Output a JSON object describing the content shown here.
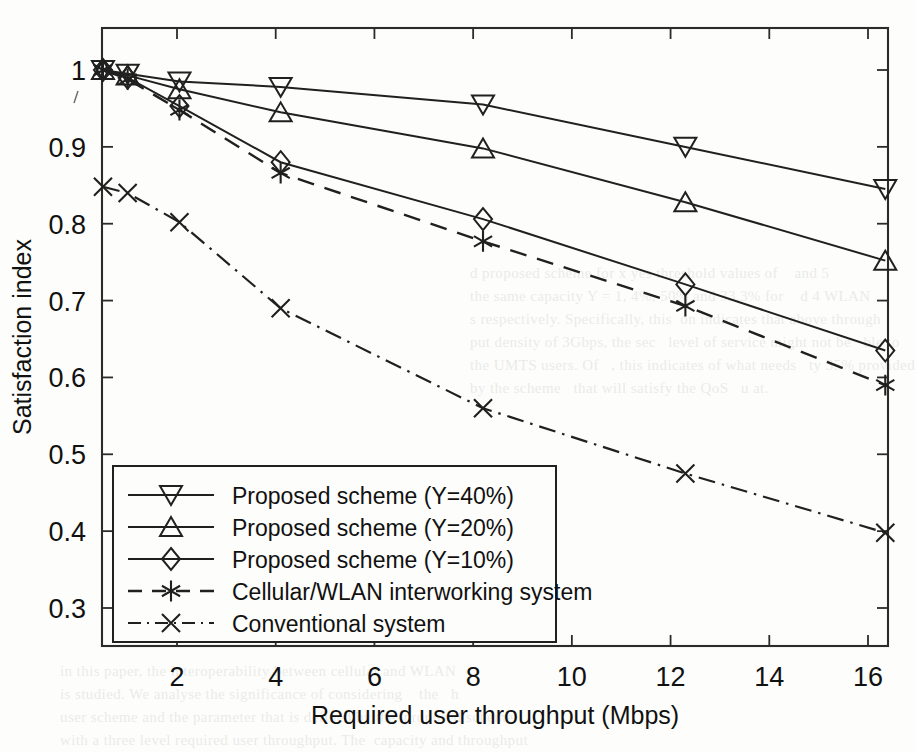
{
  "figure": {
    "background_color": "#fdfdfb",
    "ink_color": "#202020"
  },
  "chart_data": {
    "type": "line",
    "title": "",
    "xlabel": "Required user throughput (Mbps)",
    "ylabel": "Satisfaction index",
    "xlim": [
      0.48,
      16.42
    ],
    "ylim": [
      0.28,
      1.03
    ],
    "xticks": [
      2,
      4,
      6,
      8,
      10,
      12,
      14,
      16
    ],
    "xticklabels": [
      "2",
      "4",
      "6",
      "8",
      "10",
      "12",
      "14",
      "16"
    ],
    "yticks": [
      0.3,
      0.4,
      0.5,
      0.6,
      0.7,
      0.8,
      0.9,
      1.0
    ],
    "yticklabels": [
      "0.3",
      "0.4",
      "0.5",
      "0.6",
      "0.7",
      "0.8",
      "0.9",
      "1"
    ],
    "grid": false,
    "legend_position": "lower left",
    "x": [
      0.5,
      1.0,
      2.05,
      4.1,
      8.2,
      12.3,
      16.35
    ],
    "series": [
      {
        "name": "Proposed scheme (Y=40%)",
        "marker": "triangle-down",
        "linestyle": "solid",
        "values": [
          1.0,
          0.995,
          0.985,
          0.978,
          0.955,
          0.9,
          0.845
        ]
      },
      {
        "name": "Proposed scheme (Y=20%)",
        "marker": "triangle-up",
        "linestyle": "solid",
        "values": [
          1.0,
          0.993,
          0.975,
          0.945,
          0.898,
          0.828,
          0.752
        ]
      },
      {
        "name": "Proposed scheme (Y=10%)",
        "marker": "diamond",
        "linestyle": "solid",
        "values": [
          1.0,
          0.99,
          0.953,
          0.88,
          0.806,
          0.721,
          0.635
        ]
      },
      {
        "name": "Cellular/WLAN interworking system",
        "marker": "asterisk",
        "linestyle": "dashed",
        "values": [
          1.0,
          0.988,
          0.948,
          0.866,
          0.777,
          0.693,
          0.59
        ]
      },
      {
        "name": "Conventional system",
        "marker": "x",
        "linestyle": "dashdot",
        "values": [
          0.848,
          0.84,
          0.802,
          0.69,
          0.56,
          0.475,
          0.398
        ]
      }
    ]
  },
  "legend": {
    "items": [
      {
        "label": "Proposed scheme (Y=40%)",
        "marker": "triangle-down-icon",
        "style": "solid"
      },
      {
        "label": "Proposed scheme (Y=20%)",
        "marker": "triangle-up-icon",
        "style": "solid"
      },
      {
        "label": "Proposed scheme (Y=10%)",
        "marker": "diamond-icon",
        "style": "solid"
      },
      {
        "label": "Cellular/WLAN interworking system",
        "marker": "asterisk-icon",
        "style": "dashed"
      },
      {
        "label": "Conventional system",
        "marker": "x-icon",
        "style": "dashdot"
      }
    ]
  },
  "ghost_text": {
    "block_a": "d proposed scheme for x yes threshold values of    and 5\nthe same capacity Y = 1, 4%, 50% and 33.3% for    d 4 WLAN\ns respectively. Specifically, this  on indicates that above through\nput density of 3Gbps, the sec   level of service might not be   ble to\nthe UMTS users. Of   , this indicates of what needs   ty 35% provided\nby the scheme   that will satisfy the QoS   u at.",
    "block_b": "in this paper, the interoperability between cellular and WLAN\nis studied. We analyse the significance of considering    the   h\nuser scheme and the parameter that is defined by the  proposed scheme\nwith a three level required user throughput. The  capacity and throughput"
  }
}
